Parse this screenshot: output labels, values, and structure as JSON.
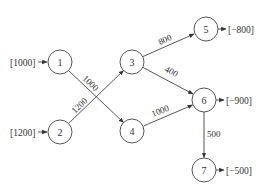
{
  "diagram": {
    "type": "network-flow",
    "nodes": [
      {
        "id": "1",
        "label": "1",
        "supply": "[1000]"
      },
      {
        "id": "2",
        "label": "2",
        "supply": "[1200]"
      },
      {
        "id": "3",
        "label": "3"
      },
      {
        "id": "4",
        "label": "4"
      },
      {
        "id": "5",
        "label": "5",
        "demand": "[−800]"
      },
      {
        "id": "6",
        "label": "6",
        "demand": "[−900]"
      },
      {
        "id": "7",
        "label": "7",
        "demand": "[−500]"
      }
    ],
    "edges": [
      {
        "from": "1",
        "to": "4",
        "flow": "1000"
      },
      {
        "from": "2",
        "to": "3",
        "flow": "1200"
      },
      {
        "from": "3",
        "to": "5",
        "flow": "800"
      },
      {
        "from": "3",
        "to": "6",
        "flow": "400"
      },
      {
        "from": "4",
        "to": "6",
        "flow": "1000"
      },
      {
        "from": "6",
        "to": "7",
        "flow": "500"
      }
    ]
  }
}
